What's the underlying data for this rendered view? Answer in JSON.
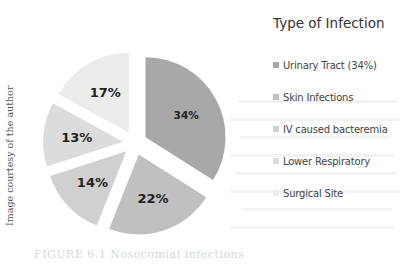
{
  "chart_data": {
    "type": "pie",
    "title": "Type of Infection",
    "categories": [
      "Urinary Tract (34%)",
      "Skin Infections",
      "IV caused bacteremia",
      "Lower Respiratory",
      "Surgical Site"
    ],
    "values": [
      34,
      22,
      14,
      13,
      17
    ],
    "data_labels": [
      "34%",
      "22%",
      "14%",
      "13%",
      "17%"
    ],
    "colors": [
      "#a8a8a8",
      "#c0c0c0",
      "#d0d0d0",
      "#dcdcdc",
      "#ececec"
    ],
    "exploded": true,
    "start_angle_deg": 0,
    "direction": "clockwise",
    "legend_position": "right"
  },
  "legend": {
    "title": "Type of Infection",
    "items": [
      {
        "label": "Urinary Tract (34%)",
        "color": "#a8a8a8"
      },
      {
        "label": "Skin Infections",
        "color": "#c0c0c0"
      },
      {
        "label": "IV caused bacteremia",
        "color": "#d0d0d0"
      },
      {
        "label": "Lower Respiratory",
        "color": "#dcdcdc"
      },
      {
        "label": "Surgical Site",
        "color": "#ececec"
      }
    ]
  },
  "side_credit": "Image courtesy of the author",
  "caption": "FIGURE 6.1    Nosocomial infections"
}
